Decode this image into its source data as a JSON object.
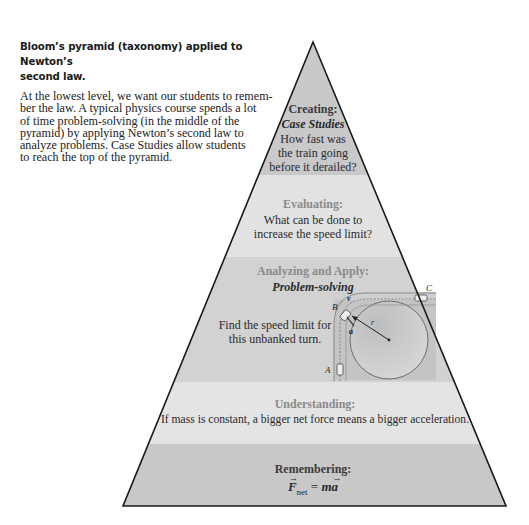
{
  "caption": {
    "title_line1": "Bloom’s pyramid (taxonomy) applied to Newton’s",
    "title_line2": "second law.",
    "body_lines": [
      "At the lowest level, we want our students to  remem-",
      "ber the law. A typical physics course spends a lot",
      "of  time  problem-solving  (in  the  middle  of  the",
      "pyramid)  by  applying  Newton’s  second  law  to",
      "analyze problems. Case Studies allow students",
      "to reach the top of the pyramid."
    ]
  },
  "pyramid": {
    "colors": {
      "dark_band": "#c9c9c9",
      "light_band": "#e2e2e2",
      "outline": "#1a1a1a"
    },
    "tiers": [
      {
        "level": "Creating:",
        "subtitle": "Case Studies",
        "text_lines": [
          "How fast was",
          "the train going",
          "before it derailed?"
        ]
      },
      {
        "level": "Evaluating:",
        "text_lines": [
          "What can be done to",
          "increase the speed limit?"
        ]
      },
      {
        "level": "Analyzing and Apply:",
        "subtitle": "Problem-solving",
        "text_lines": [
          "Find the speed limit for",
          "this unbanked turn."
        ],
        "figure": {
          "point_labels": [
            "A",
            "B",
            "C"
          ],
          "vector_labels": [
            "v",
            "a"
          ],
          "radius_label": "r"
        }
      },
      {
        "level": "Understanding:",
        "text_lines": [
          "If mass is constant, a bigger net force means a bigger acceleration."
        ]
      },
      {
        "level": "Remembering:",
        "formula": {
          "lhs": "F",
          "lhs_subscript": "net",
          "equals": "=",
          "rhs_scalar": "m",
          "rhs_vector": "a"
        }
      }
    ]
  }
}
